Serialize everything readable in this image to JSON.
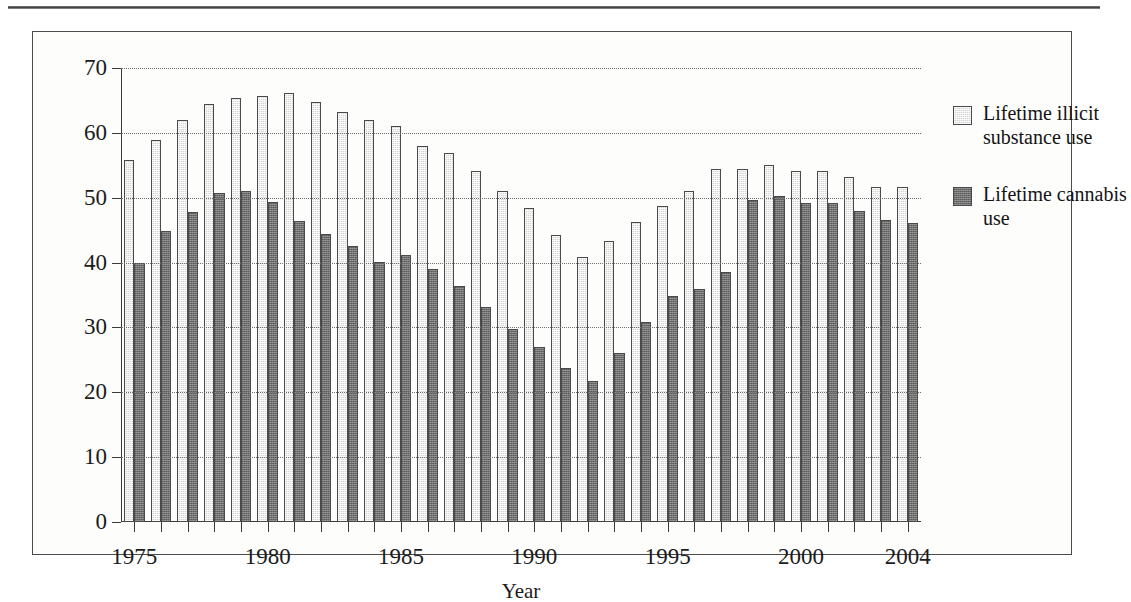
{
  "figure": {
    "background_color": "#fdfdfc",
    "frame_color": "#4c4c4c"
  },
  "legend": {
    "position": "right",
    "items": [
      {
        "label": "Lifetime illicit substance use",
        "swatch": "light-hatched-swatch",
        "color": "#d4d4d4"
      },
      {
        "label": "Lifetime cannabis use",
        "swatch": "dark-hatched-swatch",
        "color": "#6e6e6e"
      }
    ]
  },
  "chart_data": {
    "type": "bar",
    "title": "",
    "subtitle": "",
    "xlabel": "Year",
    "ylabel": "",
    "ylim": [
      0,
      70
    ],
    "ytick_step": 10,
    "yticks": [
      0,
      10,
      20,
      30,
      40,
      50,
      60,
      70
    ],
    "grid": true,
    "grid_style": "dotted-horizontal",
    "legend_position": "right",
    "xtick_labels": [
      "1975",
      "1980",
      "1985",
      "1990",
      "1995",
      "2000",
      "2004"
    ],
    "categories": [
      "1975",
      "1976",
      "1977",
      "1978",
      "1979",
      "1980",
      "1981",
      "1982",
      "1983",
      "1984",
      "1985",
      "1986",
      "1987",
      "1988",
      "1989",
      "1990",
      "1991",
      "1992",
      "1993",
      "1994",
      "1995",
      "1996",
      "1997",
      "1998",
      "1999",
      "2000",
      "2001",
      "2002",
      "2003",
      "2004"
    ],
    "series": [
      {
        "name": "Lifetime illicit substance use",
        "color": "#d4d4d4",
        "values": [
          55.8,
          58.9,
          62.0,
          64.4,
          65.3,
          65.7,
          66.2,
          64.7,
          63.2,
          62.0,
          61.0,
          58.0,
          56.9,
          54.1,
          51.1,
          48.4,
          44.3,
          40.8,
          43.4,
          46.2,
          48.8,
          51.0,
          54.5,
          54.5,
          55.1,
          54.1,
          54.1,
          53.2,
          51.6,
          51.7
        ]
      },
      {
        "name": "Lifetime cannabis use",
        "color": "#6e6e6e",
        "values": [
          40.0,
          44.8,
          47.8,
          50.7,
          51.1,
          49.3,
          46.4,
          44.4,
          42.6,
          40.1,
          41.1,
          39.0,
          36.4,
          33.1,
          29.7,
          27.0,
          23.8,
          21.8,
          26.0,
          30.8,
          34.8,
          35.9,
          38.6,
          49.7,
          50.2,
          49.2,
          49.2,
          47.9,
          46.6,
          46.1
        ]
      }
    ]
  }
}
